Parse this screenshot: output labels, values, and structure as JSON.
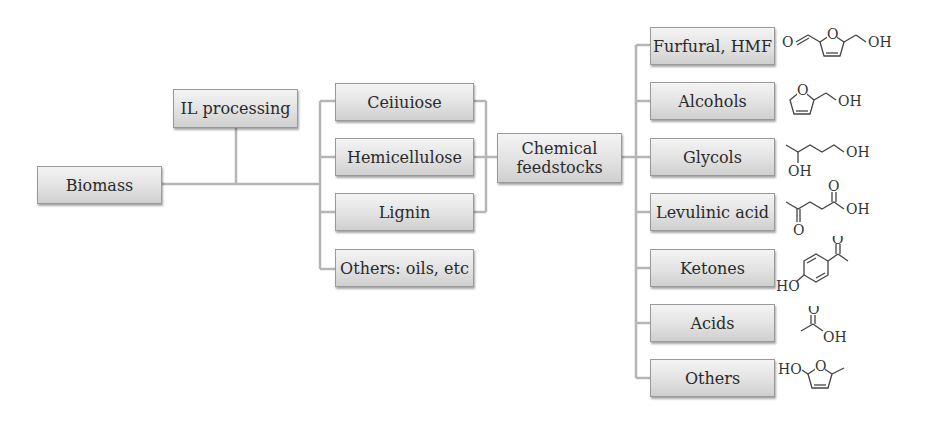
{
  "diagram": {
    "root": {
      "label": "Biomass"
    },
    "process": {
      "label": "IL processing"
    },
    "components": [
      {
        "label": "Ceiiuiose"
      },
      {
        "label": "Hemicellulose"
      },
      {
        "label": "Lignin"
      },
      {
        "label": "Others: oils, etc"
      }
    ],
    "hub": {
      "label_line1": "Chemical",
      "label_line2": "feedstocks"
    },
    "products": [
      {
        "label": "Furfural, HMF",
        "structure": "5-hydroxymethylfurfural"
      },
      {
        "label": "Alcohols",
        "structure": "furfuryl alcohol"
      },
      {
        "label": "Glycols",
        "structure": "1,4-pentanediol"
      },
      {
        "label": "Levulinic acid",
        "structure": "levulinic acid"
      },
      {
        "label": "Ketones",
        "structure": "4-hydroxyacetophenone"
      },
      {
        "label": "Acids",
        "structure": "acetic acid"
      },
      {
        "label": "Others",
        "structure": "5-methylfuran-2-ol"
      }
    ],
    "chem_labels": {
      "oh": "OH",
      "o": "O",
      "ho": "HO"
    },
    "colors": {
      "connector": "#b5b5b5",
      "box_border": "#9a9a9a",
      "text": "#2a2a2a"
    }
  }
}
